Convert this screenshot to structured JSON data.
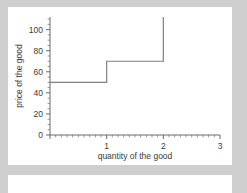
{
  "page": {
    "background_color": "#cfcfcf",
    "card_color": "#ffffff"
  },
  "chart_data": {
    "type": "line",
    "subtype": "step-post",
    "title": "",
    "subtitle": "",
    "xlabel": "quantity of the good",
    "ylabel": "price of the good",
    "xlim": [
      0,
      3
    ],
    "ylim": [
      0,
      112
    ],
    "x_ticks": [
      0,
      1,
      2,
      3
    ],
    "x_tick_labels": [
      "",
      "1",
      "2",
      "3"
    ],
    "x_minor_tick_step": 0.1,
    "y_ticks": [
      0,
      20,
      40,
      60,
      80,
      100
    ],
    "y_tick_labels": [
      "0",
      "20",
      "40",
      "60",
      "80",
      "100"
    ],
    "y_minor_tick_step": 5,
    "grid": false,
    "legend": null,
    "line_color": "#808080",
    "axis_color": "#5a5a5a",
    "series": [
      {
        "name": "supply step function",
        "points": [
          {
            "x": 0.0,
            "y": 50
          },
          {
            "x": 1.0,
            "y": 50
          },
          {
            "x": 1.0,
            "y": 70
          },
          {
            "x": 2.0,
            "y": 70
          },
          {
            "x": 2.0,
            "y": 112
          }
        ],
        "step_levels": [
          {
            "x_from": 0,
            "x_to": 1,
            "price": 50
          },
          {
            "x_from": 1,
            "x_to": 2,
            "price": 70
          },
          {
            "x_from": 2,
            "x_to": 2,
            "price": 112
          }
        ]
      }
    ],
    "annotations": []
  }
}
